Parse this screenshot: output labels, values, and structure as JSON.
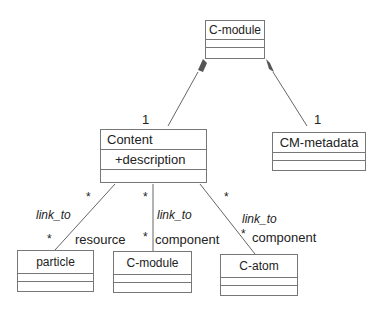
{
  "classes": {
    "top_cmodule": {
      "name": "C-module"
    },
    "content": {
      "name": "Content",
      "attribute": "+description"
    },
    "cm_metadata": {
      "name": "CM-metadata"
    },
    "particle": {
      "name": "particle"
    },
    "bottom_cmodule": {
      "name": "C-module"
    },
    "catom": {
      "name": "C-atom"
    }
  },
  "labels": {
    "content_mult": "1",
    "metadata_mult": "1",
    "star": "*",
    "link_to": "link_to",
    "role_resource": "resource",
    "role_component": "component"
  },
  "colors": {
    "line": "#666666",
    "diamond": "#555555"
  }
}
